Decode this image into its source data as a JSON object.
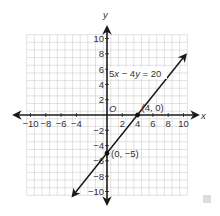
{
  "chart_data": {
    "type": "line",
    "title": "",
    "xlabel": "x",
    "ylabel": "y",
    "xlim": [
      -10,
      10
    ],
    "ylim": [
      -10,
      10
    ],
    "grid": true,
    "grid_step": 1,
    "x_ticks": [
      -10,
      -8,
      -6,
      -4,
      2,
      4,
      6,
      8,
      10
    ],
    "x_tick_labels": [
      "−10",
      "−8",
      "−6",
      "−4",
      "2",
      "4",
      "6",
      "8",
      "10"
    ],
    "y_ticks": [
      10,
      8,
      6,
      4,
      2,
      -2,
      -4,
      -6,
      -8,
      -10
    ],
    "y_tick_labels": [
      "10",
      "8",
      "6",
      "4",
      "2",
      "−2",
      "−4",
      "−6",
      "−8",
      "−10"
    ],
    "origin_label": "O",
    "series": [
      {
        "name": "5x − 4y = 20",
        "equation": "5x - 4y = 20",
        "slope": 1.25,
        "intercept": -5,
        "x": [
          -4.5,
          10.3
        ],
        "y": [
          -10.6,
          7.9
        ]
      }
    ],
    "points": [
      {
        "x": 4,
        "y": 0,
        "label": "(4, 0)"
      },
      {
        "x": 0,
        "y": -5,
        "label": "(0, −5)"
      }
    ],
    "annotations": [
      {
        "text": "5x − 4y = 20",
        "x": 0.2,
        "y": 5.5
      }
    ],
    "colors": {
      "grid": "#cfcfcf",
      "axis": "#1a1a1a",
      "line": "#1a1a1a",
      "text": "#333333"
    }
  },
  "labels": {
    "x_axis": "x",
    "y_axis": "y",
    "origin": "O",
    "equation_5": "5",
    "equation_x": "x",
    "equation_mid": " − 4",
    "equation_y": "y",
    "equation_end": " = 20",
    "point_a": "(4, 0)",
    "point_b": "(0, −5)"
  }
}
